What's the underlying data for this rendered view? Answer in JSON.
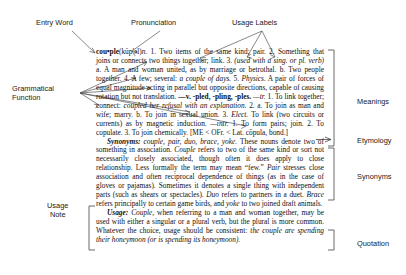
{
  "diagram": {
    "callouts": {
      "entry_word": "Entry Word",
      "pronunciation": "Pronunciation",
      "usage_labels": "Usage Labels",
      "grammatical_function": "Grammatical\nFunction",
      "usage_note": "Usage\nNote",
      "meanings": "Meanings",
      "etymology": "Etymology",
      "synonyms": "Synonyms",
      "quotation": "Quotation"
    }
  },
  "entry": {
    "headword": "cou•ple",
    "pronunciation": "(kŭp′əl)",
    "part_of_speech": "n.",
    "senses_text_1": " 1. Two items of the same kind; pair. 2. Something that joins or connects two things together; link. 3. ",
    "senses_usage_label_1": "(used with a sing. or pl. verb)",
    "senses_text_2": " a. A man and woman united, as by marriage or betrothal. b. Two people together. 4. A few; several: ",
    "senses_italic_1": "a couple of days.",
    "senses_num_5": " 5. ",
    "senses_label_physics": "Physics.",
    "senses_text_3": " A pair of forces of equal magnitude acting in parallel but opposite directions, capable of causing rotation but not translation. ",
    "inflections": "—v. -pled, -pling, -ples.",
    "verb_tr_label": " —tr.",
    "verb_text_1": " 1. To link together; connect: ",
    "verb_italic_1": "coupled her refusal with an explanation.",
    "verb_text_2": " 2. a. To join as man and wife; marry. b. To join in sexual union. 3. ",
    "verb_label_elect": "Elect.",
    "verb_text_3": " To link (two circuits or currents) as by magnetic induction.",
    "verb_intr_label": " —intr.",
    "verb_text_4": " 1. To form pairs; join. 2. To copulate. 3. To join chemically.",
    "etymology_text": " [ME < OFr. < Lat. cōpula, bond.]",
    "synonyms_head": "Synonyms:",
    "synonyms_list": " couple, pair, duo, brace, yoke.",
    "synonyms_body_1": " These nouns denote two of something in association. ",
    "synonyms_it_couple": "Couple",
    "synonyms_body_2": " refers to two of the same kind or sort not necessarily closely associated, though often it does apply to close relationship. Less formally the term may mean “few.” ",
    "synonyms_it_pair": "Pair",
    "synonyms_body_3": " stresses close association and often reciprocal dependence of things (as in the case of gloves or pajamas). Sometimes it denotes a single thing with independent parts (such as shears or spectacles). ",
    "synonyms_it_duo": "Duo",
    "synonyms_body_4": " refers to partners in a duet. ",
    "synonyms_it_brace": "Brace",
    "synonyms_body_5": " refers principally to certain game birds, and ",
    "synonyms_it_yoke": "yoke",
    "synonyms_body_6": " to two joined draft animals.",
    "usage_head": "Usage:",
    "usage_it_couple": " Couple,",
    "usage_body_1": " when referring to a man and woman together, may be used with either a singular or a plural verb, but the plural is more common. Whatever the choice, usage should be consistent: ",
    "usage_quote_1": "the couple are spending their honeymoon",
    "usage_quote_2": " (or ",
    "usage_quote_3": "is spending its honeymoon",
    "usage_quote_4": ")."
  },
  "colors": {
    "text": "#111111",
    "label_text": "#1a1a1a",
    "leader_line": "#555555",
    "bracket": "#444444",
    "background": "#ffffff"
  }
}
